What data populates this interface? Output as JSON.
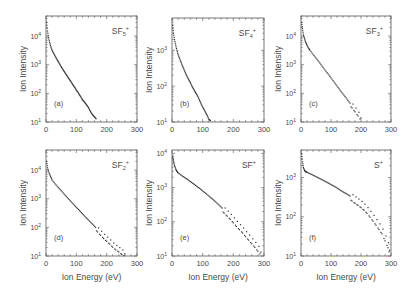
{
  "figure": {
    "xlabel": "Ion Energy (eV)",
    "ylabel": "Ion Intensity"
  },
  "chart_data": [
    {
      "type": "scatter",
      "panel": "(a)",
      "species": "SF5+",
      "species_base": "SF",
      "species_sub": "5",
      "species_sup": "+",
      "xlabel": "",
      "ylabel": "Ion Intensity",
      "xlim": [
        0,
        300
      ],
      "ylim_log10": [
        1,
        4.7
      ],
      "yscale": "log",
      "xticks": [
        0,
        100,
        200,
        300
      ],
      "yticks": [
        "10^1",
        "10^2",
        "10^3",
        "10^4"
      ],
      "x": [
        2,
        5,
        8,
        12,
        16,
        20,
        25,
        30,
        35,
        40,
        45,
        50,
        55,
        60,
        65,
        70,
        75,
        80,
        85,
        90,
        95,
        100,
        105,
        110,
        115,
        120,
        125,
        130,
        135,
        140,
        145,
        150,
        155,
        160,
        165
      ],
      "y": [
        30000,
        15000,
        9000,
        6000,
        4200,
        3200,
        2500,
        2000,
        1600,
        1300,
        1050,
        850,
        700,
        580,
        480,
        400,
        330,
        280,
        230,
        190,
        160,
        130,
        110,
        90,
        75,
        60,
        52,
        45,
        38,
        32,
        25,
        20,
        17,
        15,
        13
      ]
    },
    {
      "type": "scatter",
      "panel": "(b)",
      "species": "SF4+",
      "species_base": "SF",
      "species_sub": "4",
      "species_sup": "+",
      "xlabel": "",
      "ylabel": "Ion Intensity",
      "xlim": [
        0,
        300
      ],
      "ylim_log10": [
        1,
        3.9
      ],
      "yscale": "log",
      "xticks": [
        0,
        100,
        200,
        300
      ],
      "yticks": [
        "10^1",
        "10^2",
        "10^3"
      ],
      "x": [
        2,
        5,
        8,
        12,
        16,
        20,
        25,
        30,
        35,
        40,
        45,
        50,
        55,
        60,
        65,
        70,
        75,
        80,
        85,
        90,
        95,
        100,
        105,
        110,
        115,
        120,
        125
      ],
      "y": [
        5000,
        3000,
        2000,
        1400,
        1000,
        750,
        580,
        450,
        350,
        280,
        220,
        180,
        150,
        125,
        100,
        85,
        70,
        60,
        50,
        40,
        32,
        26,
        22,
        18,
        15,
        12,
        11
      ]
    },
    {
      "type": "scatter",
      "panel": "(c)",
      "species": "SF3+",
      "species_base": "SF",
      "species_sub": "3",
      "species_sup": "+",
      "xlabel": "",
      "ylabel": "Ion Intensity",
      "xlim": [
        0,
        300
      ],
      "ylim_log10": [
        1,
        4.7
      ],
      "yscale": "log",
      "xticks": [
        0,
        100,
        200,
        300
      ],
      "yticks": [
        "10^1",
        "10^2",
        "10^3",
        "10^4"
      ],
      "x": [
        2,
        5,
        8,
        12,
        16,
        20,
        25,
        30,
        40,
        50,
        60,
        70,
        80,
        90,
        100,
        110,
        120,
        130,
        140,
        150,
        160,
        170,
        180,
        190,
        200
      ],
      "y": [
        30000,
        18000,
        11000,
        8000,
        6000,
        4800,
        3800,
        3200,
        2300,
        1700,
        1250,
        900,
        650,
        480,
        350,
        250,
        180,
        130,
        95,
        70,
        50,
        38,
        28,
        20,
        14
      ]
    },
    {
      "type": "scatter",
      "panel": "(d)",
      "species": "SF2+",
      "species_base": "SF",
      "species_sub": "2",
      "species_sup": "+",
      "xlabel": "Ion Energy (eV)",
      "ylabel": "Ion Intensity",
      "xlim": [
        0,
        300
      ],
      "ylim_log10": [
        1,
        4.7
      ],
      "yscale": "log",
      "xticks": [
        0,
        100,
        200,
        300
      ],
      "yticks": [
        "10^1",
        "10^2",
        "10^3",
        "10^4"
      ],
      "x": [
        2,
        5,
        10,
        15,
        20,
        30,
        40,
        50,
        60,
        70,
        80,
        90,
        100,
        110,
        120,
        130,
        140,
        150,
        160,
        170,
        180,
        190,
        200,
        210,
        220,
        230,
        240,
        250,
        260
      ],
      "y": [
        20000,
        12000,
        8000,
        6000,
        4500,
        3300,
        2500,
        1900,
        1450,
        1100,
        850,
        650,
        500,
        390,
        300,
        230,
        180,
        140,
        110,
        85,
        65,
        50,
        40,
        32,
        25,
        20,
        17,
        14,
        12
      ]
    },
    {
      "type": "scatter",
      "panel": "(e)",
      "species": "SF+",
      "species_base": "SF",
      "species_sub": "",
      "species_sup": "+",
      "xlabel": "Ion Energy (eV)",
      "ylabel": "Ion Intensity",
      "xlim": [
        0,
        300
      ],
      "ylim_log10": [
        1,
        4.1
      ],
      "yscale": "log",
      "xticks": [
        0,
        100,
        200,
        300
      ],
      "yticks": [
        "10^1",
        "10^2",
        "10^3",
        "10^4"
      ],
      "x": [
        2,
        5,
        8,
        12,
        16,
        20,
        30,
        40,
        50,
        60,
        70,
        80,
        90,
        100,
        110,
        120,
        130,
        140,
        150,
        160,
        170,
        180,
        190,
        200,
        210,
        220,
        230,
        240,
        250,
        260,
        270,
        280,
        290
      ],
      "y": [
        8000,
        6000,
        4500,
        3500,
        3000,
        2700,
        2300,
        2000,
        1750,
        1500,
        1300,
        1100,
        950,
        800,
        680,
        570,
        480,
        400,
        330,
        270,
        220,
        180,
        145,
        115,
        90,
        72,
        58,
        45,
        36,
        28,
        22,
        17,
        13
      ]
    },
    {
      "type": "scatter",
      "panel": "(f)",
      "species": "S+",
      "species_base": "S",
      "species_sub": "",
      "species_sup": "+",
      "xlabel": "Ion Energy (eV)",
      "ylabel": "Ion Intensity",
      "xlim": [
        0,
        300
      ],
      "ylim_log10": [
        1,
        3.7
      ],
      "yscale": "log",
      "xticks": [
        0,
        100,
        200,
        300
      ],
      "yticks": [
        "10^1",
        "10^2",
        "10^3"
      ],
      "x": [
        2,
        5,
        8,
        12,
        16,
        20,
        30,
        40,
        50,
        60,
        70,
        80,
        90,
        100,
        110,
        120,
        130,
        140,
        150,
        160,
        170,
        180,
        190,
        200,
        210,
        220,
        230,
        240,
        250,
        260,
        270,
        280,
        290,
        295
      ],
      "y": [
        4000,
        2500,
        1800,
        1500,
        1400,
        1350,
        1250,
        1150,
        1050,
        960,
        880,
        800,
        730,
        660,
        600,
        540,
        480,
        430,
        390,
        350,
        310,
        270,
        240,
        210,
        180,
        150,
        120,
        95,
        75,
        58,
        45,
        30,
        20,
        14
      ]
    }
  ]
}
